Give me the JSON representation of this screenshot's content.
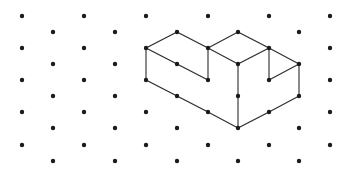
{
  "diagram": {
    "type": "isometric-dot-grid-drawing",
    "colors": {
      "background": "#ffffff",
      "dot": "#1a1a1a",
      "line": "#2b2b2b"
    },
    "grid": {
      "even_columns_x": [
        22,
        84,
        146,
        208,
        269,
        330
      ],
      "even_rows_y": [
        16,
        48,
        80,
        112,
        145
      ],
      "odd_columns_x": [
        53,
        115,
        177,
        238,
        299
      ],
      "odd_rows_y": [
        32,
        64,
        96,
        128,
        161
      ],
      "dot_radius": 2.2
    },
    "shape": {
      "name": "isometric-solid",
      "vertices": [
        [
          146,
          48
        ],
        [
          177,
          32
        ],
        [
          208,
          48
        ],
        [
          177,
          64
        ],
        [
          208,
          80
        ],
        [
          146,
          80
        ],
        [
          177,
          96
        ],
        [
          208,
          112
        ],
        [
          238,
          128
        ],
        [
          238,
          32
        ],
        [
          269,
          48
        ],
        [
          299,
          64
        ],
        [
          238,
          64
        ],
        [
          238,
          96
        ],
        [
          269,
          80
        ],
        [
          299,
          96
        ],
        [
          269,
          112
        ]
      ],
      "edges": [
        [
          [
            146,
            48
          ],
          [
            177,
            32
          ]
        ],
        [
          [
            177,
            32
          ],
          [
            208,
            48
          ]
        ],
        [
          [
            146,
            48
          ],
          [
            177,
            64
          ]
        ],
        [
          [
            177,
            64
          ],
          [
            208,
            80
          ]
        ],
        [
          [
            146,
            48
          ],
          [
            146,
            80
          ]
        ],
        [
          [
            208,
            48
          ],
          [
            208,
            80
          ]
        ],
        [
          [
            146,
            80
          ],
          [
            177,
            96
          ]
        ],
        [
          [
            177,
            96
          ],
          [
            208,
            112
          ]
        ],
        [
          [
            208,
            112
          ],
          [
            238,
            128
          ]
        ],
        [
          [
            208,
            48
          ],
          [
            238,
            32
          ]
        ],
        [
          [
            238,
            32
          ],
          [
            269,
            48
          ]
        ],
        [
          [
            269,
            48
          ],
          [
            299,
            64
          ]
        ],
        [
          [
            208,
            48
          ],
          [
            238,
            64
          ]
        ],
        [
          [
            238,
            64
          ],
          [
            269,
            48
          ]
        ],
        [
          [
            238,
            64
          ],
          [
            238,
            96
          ]
        ],
        [
          [
            238,
            96
          ],
          [
            238,
            128
          ]
        ],
        [
          [
            269,
            48
          ],
          [
            269,
            80
          ]
        ],
        [
          [
            269,
            80
          ],
          [
            299,
            64
          ]
        ],
        [
          [
            299,
            64
          ],
          [
            299,
            96
          ]
        ],
        [
          [
            238,
            128
          ],
          [
            269,
            112
          ]
        ],
        [
          [
            269,
            112
          ],
          [
            299,
            96
          ]
        ]
      ]
    }
  }
}
